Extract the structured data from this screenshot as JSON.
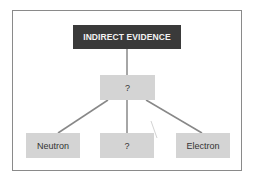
{
  "diagram": {
    "root": {
      "label": "INDIRECT EVIDENCE",
      "color": "#3a3a3a",
      "text_color": "#f2f2f2"
    },
    "middle": {
      "label": "?",
      "color": "#d4d4d4"
    },
    "children": [
      {
        "label": "Neutron"
      },
      {
        "label": "?"
      },
      {
        "label": "Electron"
      }
    ],
    "edges": [
      {
        "from": "INDIRECT EVIDENCE",
        "to": "?"
      },
      {
        "from": "?",
        "to": "Neutron"
      },
      {
        "from": "?",
        "to": "?"
      },
      {
        "from": "?",
        "to": "Electron"
      }
    ],
    "line_color": "#888888",
    "frame_color": "#8a8a8a"
  }
}
